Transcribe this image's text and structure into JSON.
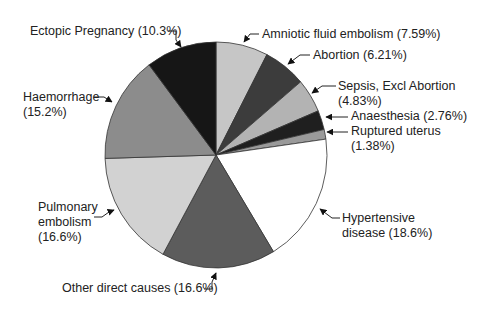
{
  "chart_data": {
    "type": "pie",
    "title": "",
    "start_angle_deg": 0,
    "direction": "clockwise",
    "slices": [
      {
        "label": "Amniotic fluid embolism",
        "value": 7.59,
        "color": "#c6c6c6"
      },
      {
        "label": "Abortion",
        "value": 6.21,
        "color": "#3c3c3c"
      },
      {
        "label": "Sepsis, Excl Abortion",
        "value": 4.83,
        "color": "#b3b3b3"
      },
      {
        "label": "Anaesthesia",
        "value": 2.76,
        "color": "#1f1f1f"
      },
      {
        "label": "Ruptured uterus",
        "value": 1.38,
        "color": "#9a9a9a"
      },
      {
        "label": "Hypertensive disease",
        "value": 18.6,
        "color": "#ffffff"
      },
      {
        "label": "Other direct causes",
        "value": 16.6,
        "color": "#5c5c5c"
      },
      {
        "label": "Pulmonary embolism",
        "value": 16.6,
        "color": "#d2d2d2"
      },
      {
        "label": "Haemorrhage",
        "value": 15.2,
        "color": "#8c8c8c"
      },
      {
        "label": "Ectopic Pregnancy",
        "value": 10.3,
        "color": "#161616"
      }
    ]
  },
  "labels": {
    "amniotic": {
      "line1": "Amniotic fluid embolism (7.59%)"
    },
    "abortion": {
      "line1": "Abortion (6.21%)"
    },
    "sepsis": {
      "line1": "Sepsis, Excl Abortion",
      "line2": "(4.83%)"
    },
    "anaesthesia": {
      "line1": "Anaesthesia (2.76%)"
    },
    "ruptured": {
      "line1": "Ruptured uterus",
      "line2": "(1.38%)"
    },
    "hypertensive": {
      "line1": "Hypertensive",
      "line2": "disease (18.6%)"
    },
    "other": {
      "line1": "Other direct causes (16.6%)"
    },
    "pulmonary": {
      "line1": "Pulmonary",
      "line2": "embolism",
      "line3": "(16.6%)"
    },
    "haemorrhage": {
      "line1": "Haemorrhage",
      "line2": "(15.2%)"
    },
    "ectopic": {
      "line1": "Ectopic Pregnancy (10.3%)"
    }
  }
}
